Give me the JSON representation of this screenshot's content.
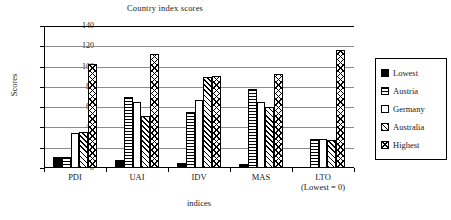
{
  "chart_data": {
    "type": "bar",
    "title": "Country index scores",
    "xlabel": "indices",
    "ylabel": "Scores",
    "ylim": [
      0,
      140
    ],
    "ytick_step": 20,
    "yticks": [
      0,
      20,
      40,
      60,
      80,
      100,
      120,
      140
    ],
    "grid": true,
    "legend_position": "right",
    "categories": [
      "PDI",
      "UAI",
      "IDV",
      "MAS",
      "LTO"
    ],
    "category_sublabels": [
      "",
      "",
      "",
      "",
      "(Lowest = 0)"
    ],
    "series": [
      {
        "name": "Lowest",
        "pattern": "solid",
        "values": [
          11,
          8,
          5,
          4,
          0
        ]
      },
      {
        "name": "Austria",
        "pattern": "hlines",
        "values": [
          11,
          70,
          55,
          78,
          29
        ]
      },
      {
        "name": "Germany",
        "pattern": "white",
        "values": [
          35,
          65,
          67,
          65,
          29
        ]
      },
      {
        "name": "Australia",
        "pattern": "diagonal",
        "values": [
          36,
          51,
          90,
          60,
          28
        ]
      },
      {
        "name": "Highest",
        "pattern": "crosshatch",
        "values": [
          103,
          112,
          91,
          93,
          116
        ]
      }
    ]
  }
}
